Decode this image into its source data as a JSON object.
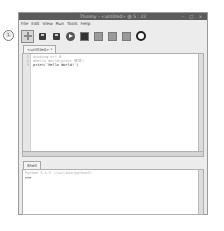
{
  "annotation": {
    "label": "①"
  },
  "window": {
    "title": "Thonny - <untitled> @ 5 : 22",
    "controls": [
      "‒",
      "□",
      "×"
    ]
  },
  "menu": {
    "items": [
      "File",
      "Edit",
      "View",
      "Run",
      "Tools",
      "Help"
    ]
  },
  "toolbar": {
    "buttons": [
      {
        "name": "new-file",
        "icon": "plus-icon"
      },
      {
        "name": "open-file",
        "icon": "open-disk-icon"
      },
      {
        "name": "save-file",
        "icon": "save-disk-icon"
      },
      {
        "name": "run",
        "icon": "run-play-icon"
      },
      {
        "name": "debug",
        "icon": "debug-icon"
      },
      {
        "name": "step-over",
        "icon": "step-over-icon"
      },
      {
        "name": "step-into",
        "icon": "step-into-icon"
      },
      {
        "name": "step-out",
        "icon": "step-out-icon"
      },
      {
        "name": "stop",
        "icon": "stop-icon"
      }
    ]
  },
  "editor": {
    "tab_label": "<untitled> *",
    "lines": [
      {
        "num": "1",
        "text": "#coding:utf-8",
        "kind": "comment"
      },
      {
        "num": "2",
        "text": "#Hello World(print 練習)",
        "kind": "comment"
      },
      {
        "num": "3",
        "text": "print('Hello World!')",
        "kind": "normal"
      }
    ]
  },
  "shell": {
    "tab_label": "Shell",
    "banner": "Python 3.5.3 (/usr/bin/python3)",
    "prompt": ">>>"
  },
  "colors": {
    "titlebar": "#5c5c5c",
    "window_bg": "#ececec",
    "editor_bg": "#ffffff"
  }
}
